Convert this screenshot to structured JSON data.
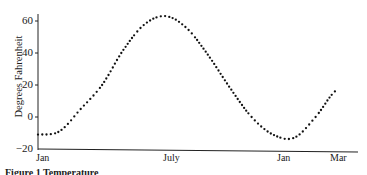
{
  "chart_data": {
    "type": "scatter",
    "title": "",
    "xlabel": "",
    "ylabel": "Degrees Fahrenheit",
    "ylim": [
      -20,
      65
    ],
    "yticks": [
      -20,
      0,
      20,
      40,
      60
    ],
    "xtick_labels": [
      "Jan",
      "July",
      "Jan",
      "Mar"
    ],
    "grid": false,
    "legend": null,
    "x": [
      "Jan",
      "Feb",
      "Mar",
      "Apr",
      "May",
      "Jun",
      "Jul",
      "Aug",
      "Sep",
      "Oct",
      "Nov",
      "Dec",
      "Jan",
      "Feb",
      "Mar"
    ],
    "values": [
      -11,
      -9,
      5,
      20,
      42,
      58,
      63,
      55,
      38,
      18,
      0,
      -11,
      -13,
      0,
      17
    ],
    "caption": "Figure 1 Temperature..."
  },
  "axis": {
    "ylabel": "Degrees Fahrenheit",
    "yticks": [
      "60",
      "40",
      "20",
      "0",
      "−20"
    ],
    "xticks": [
      "Jan",
      "July",
      "Jan",
      "Mar"
    ]
  },
  "caption": "Figure 1  Temperature"
}
